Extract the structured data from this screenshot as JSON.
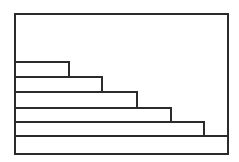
{
  "figure": {
    "title": "",
    "background_color": "#ffffff",
    "stroke_color": "#2b2b2b",
    "fill_color": "#ffffff",
    "frame": {
      "x": 15,
      "y": 14,
      "width": 213,
      "height": 140,
      "stroke_width": 2
    }
  },
  "chart_data": {
    "type": "bar",
    "orientation": "horizontal",
    "title": "",
    "subtitle": "",
    "xlabel": "",
    "ylabel": "",
    "grid": false,
    "legend": false,
    "legend_position": "none",
    "axis_visible": false,
    "tick_labels_visible": false,
    "data_labels_visible": false,
    "categories": [
      "1",
      "2",
      "3",
      "4",
      "5",
      "6"
    ],
    "values": [
      25,
      41,
      57,
      73,
      89,
      100
    ],
    "xlim": [
      0,
      100
    ],
    "ylim": [
      0,
      6
    ],
    "bars": [
      {
        "index": 1,
        "value": 25,
        "label": "",
        "top": 62,
        "bottom": 77,
        "right": 69
      },
      {
        "index": 2,
        "value": 41,
        "label": "",
        "top": 77,
        "bottom": 92,
        "right": 102
      },
      {
        "index": 3,
        "value": 57,
        "label": "",
        "top": 92,
        "bottom": 108,
        "right": 137
      },
      {
        "index": 4,
        "value": 73,
        "label": "",
        "top": 108,
        "bottom": 122,
        "right": 171
      },
      {
        "index": 5,
        "value": 89,
        "label": "",
        "top": 122,
        "bottom": 136,
        "right": 204
      },
      {
        "index": 6,
        "value": 100,
        "label": "",
        "top": 136,
        "bottom": 154,
        "right": 228
      }
    ],
    "annotations": []
  }
}
